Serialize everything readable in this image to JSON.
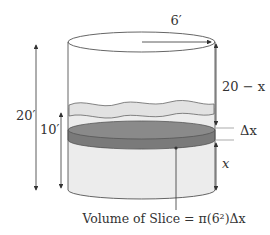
{
  "diagram": {
    "labels": {
      "radius": "6′",
      "total_height": "20′",
      "water_height": "10′",
      "distance_to_top": "20 − x",
      "slice_thickness": "Δx",
      "slice_height": "x",
      "caption": "Volume of Slice = π(6²)Δx"
    },
    "colors": {
      "outline": "#555555",
      "water_fill": "#ececec",
      "wave_fill": "#e2e2e2",
      "slice_top": "#8a8a8a",
      "slice_side": "#7a7a7a",
      "text": "#333333",
      "arrow": "#333333"
    }
  }
}
